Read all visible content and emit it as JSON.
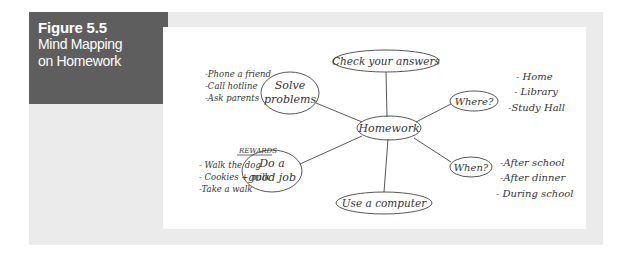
{
  "figure": {
    "number": "Figure 5.5",
    "title_line1": "Mind Mapping",
    "title_line2": "on Homework"
  },
  "mind_map": {
    "center": "Homework",
    "nodes": {
      "check": "Check your answers",
      "solve_1": "Solve",
      "solve_2": "problems",
      "where": "Where?",
      "when": "When?",
      "job_1": "Do a",
      "job_2": "good job",
      "computer": "Use a computer"
    },
    "solve_list": [
      "-Phone a friend",
      "-Call hotline",
      "-Ask parents"
    ],
    "where_list": [
      "- Home",
      "- Library",
      "-Study Hall"
    ],
    "when_list": [
      "-After school",
      "-After dinner",
      "- During school"
    ],
    "rewards": {
      "heading": "REWARDS",
      "items": [
        "- Walk the dog",
        "- Cookies + milk",
        "-Take a walk"
      ]
    }
  },
  "colors": {
    "panel": "#ebebeb",
    "title_box": "#5e5e5e",
    "ink": "#333333"
  }
}
